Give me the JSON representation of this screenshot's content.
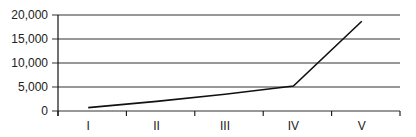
{
  "chart_data": {
    "type": "line",
    "title": "",
    "xlabel": "",
    "ylabel": "",
    "categories": [
      "I",
      "II",
      "III",
      "IV",
      "V"
    ],
    "series": [
      {
        "name": "",
        "values": [
          700,
          2000,
          3500,
          5200,
          18700
        ]
      }
    ],
    "ylim": [
      0,
      20000
    ],
    "yticks": [
      0,
      5000,
      10000,
      15000,
      20000
    ],
    "ytick_labels": [
      "0",
      "5,000",
      "10,000",
      "15,000",
      "20,000"
    ],
    "grid": {
      "horizontal": true,
      "vertical": false
    },
    "legend": null,
    "colors": {
      "line": "#111111",
      "grid": "#333333",
      "axis": "#111111"
    }
  }
}
